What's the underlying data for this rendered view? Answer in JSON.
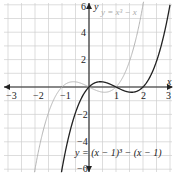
{
  "chart_data": {
    "type": "line",
    "title": "",
    "xlabel": "x",
    "ylabel": "y",
    "xlim": [
      -3,
      3
    ],
    "ylim": [
      -6,
      6
    ],
    "grid": true,
    "x_ticks": [
      "-3",
      "-2",
      "-1",
      "1",
      "2",
      "3"
    ],
    "y_ticks": [
      "6",
      "4",
      "2",
      "-2",
      "-4",
      "-6"
    ],
    "series": [
      {
        "name": "y = x^3 - x",
        "label": "y = x³ − x",
        "color": "#b0b0b0",
        "function": "x^3 - x"
      },
      {
        "name": "y = (x - 1)^3 - (x - 1)",
        "label": "y = (x − 1)³ − (x − 1)",
        "color": "#222222",
        "function": "(x-1)^3 - (x-1)"
      }
    ],
    "annotations": [
      {
        "text": "y = x³ − x",
        "position": "top-right near light curve"
      },
      {
        "text": "y = (x − 1)³ − (x − 1)",
        "position": "bottom-right near dark curve"
      }
    ]
  },
  "labels": {
    "x_axis": "x",
    "y_axis": "y",
    "light_curve_eq": "y = x³ − x",
    "dark_curve_eq": "y = (x − 1)³ − (x − 1)",
    "tick_x_m3": "−3",
    "tick_x_m2": "−2",
    "tick_x_m1": "−1",
    "tick_x_1": "1",
    "tick_x_2": "2",
    "tick_x_3": "3",
    "tick_y_6": "6",
    "tick_y_4": "4",
    "tick_y_2": "2",
    "tick_y_m2": "−2",
    "tick_y_m4": "−4",
    "tick_y_m6": "−6"
  }
}
